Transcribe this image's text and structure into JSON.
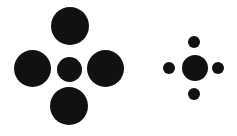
{
  "figure": {
    "background": "#ffffff",
    "circle_color": "#111111",
    "groups": [
      {
        "name": "left-cluster",
        "center": {
          "cx": 69,
          "cy": 69,
          "d": 25
        },
        "surround": [
          {
            "position": "top",
            "cx": 70,
            "cy": 26,
            "d": 38
          },
          {
            "position": "left",
            "cx": 32,
            "cy": 68,
            "d": 37
          },
          {
            "position": "right",
            "cx": 105,
            "cy": 68,
            "d": 37
          },
          {
            "position": "bottom",
            "cx": 69,
            "cy": 106,
            "d": 38
          }
        ]
      },
      {
        "name": "right-cluster",
        "center": {
          "cx": 195,
          "cy": 68,
          "d": 26
        },
        "surround": [
          {
            "position": "top",
            "cx": 194,
            "cy": 42,
            "d": 12
          },
          {
            "position": "left",
            "cx": 169,
            "cy": 68,
            "d": 12
          },
          {
            "position": "right",
            "cx": 218,
            "cy": 68,
            "d": 12
          },
          {
            "position": "bottom",
            "cx": 194,
            "cy": 94,
            "d": 12
          }
        ]
      }
    ]
  }
}
